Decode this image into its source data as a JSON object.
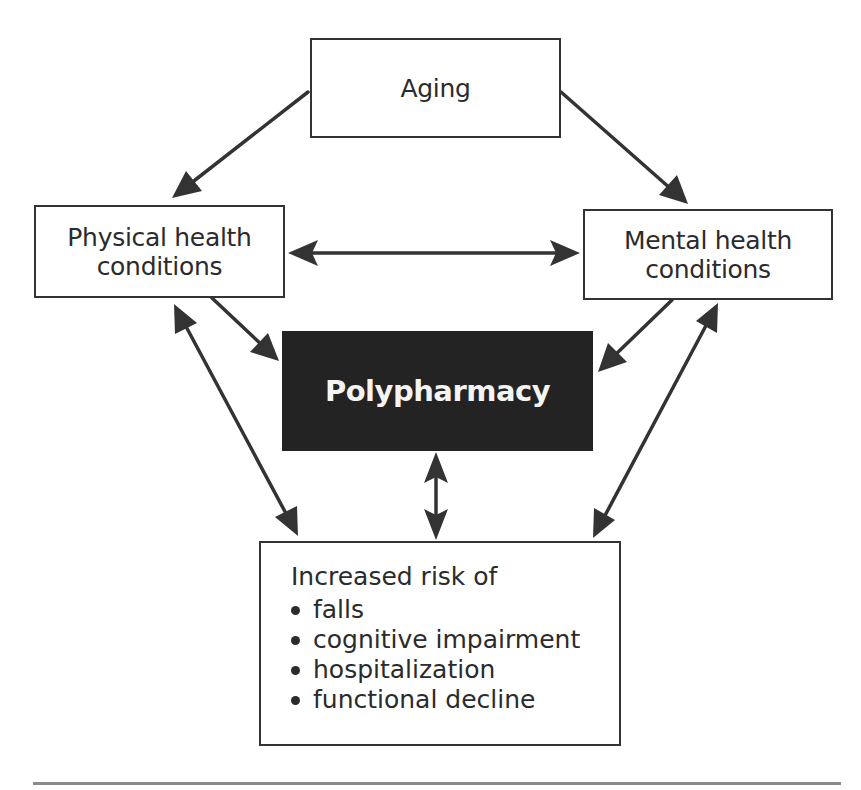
{
  "diagram": {
    "nodes": {
      "aging": {
        "label": "Aging"
      },
      "physical": {
        "label": "Physical health conditions",
        "line1": "Physical health",
        "line2": "conditions"
      },
      "mental": {
        "label": "Mental health conditions",
        "line1": "Mental health",
        "line2": "conditions"
      },
      "polypharmacy": {
        "label": "Polypharmacy"
      },
      "risk": {
        "title": "Increased risk of",
        "items": [
          "falls",
          "cognitive impairment",
          "hospitalization",
          "functional decline"
        ]
      }
    },
    "edges": [
      {
        "from": "Aging",
        "to": "Physical health conditions",
        "type": "directed"
      },
      {
        "from": "Aging",
        "to": "Mental health conditions",
        "type": "directed"
      },
      {
        "from": "Physical health conditions",
        "to": "Mental health conditions",
        "type": "bidirectional"
      },
      {
        "from": "Physical health conditions",
        "to": "Polypharmacy",
        "type": "directed"
      },
      {
        "from": "Mental health conditions",
        "to": "Polypharmacy",
        "type": "directed"
      },
      {
        "from": "Physical health conditions",
        "to": "Increased risk of",
        "type": "bidirectional"
      },
      {
        "from": "Mental health conditions",
        "to": "Increased risk of",
        "type": "bidirectional"
      },
      {
        "from": "Polypharmacy",
        "to": "Increased risk of",
        "type": "bidirectional"
      }
    ],
    "colors": {
      "stroke": "#333333",
      "highlight_fill": "#232323",
      "highlight_text": "#f4f4f4",
      "rule": "#8a8a8a"
    }
  }
}
